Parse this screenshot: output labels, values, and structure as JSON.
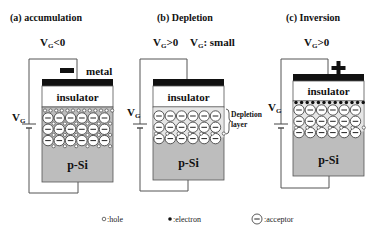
{
  "colors": {
    "metal": "#111111",
    "insulator": "#ffffff",
    "substrate": "#bdbdbd",
    "depletion_bg": "#e6e6e6",
    "acceptor_fill": "#ffffff",
    "wire": "#555555"
  },
  "panels": [
    {
      "id": "accumulation",
      "title": "(a) accumulation",
      "vg_label": "V",
      "vg_sub": "G",
      "vg_cond": "<0",
      "charge_sign": "minus",
      "metal_label": "metal",
      "insulator_label": "insulator",
      "substrate_label": "p-Si",
      "side_label": "V",
      "side_sub": "G",
      "surface": "holes"
    },
    {
      "id": "depletion",
      "title": "(b) Depletion",
      "vg_label": "V",
      "vg_sub": "G",
      "vg_cond": ">0",
      "vg_extra_label": "V",
      "vg_extra_sub": "G",
      "vg_extra": ": small",
      "insulator_label": "insulator",
      "substrate_label": "p-Si",
      "side_label": "V",
      "side_sub": "G",
      "depletion_label_1": "Depletion",
      "depletion_label_2": "layer",
      "surface": "none"
    },
    {
      "id": "inversion",
      "title": "(c) Inversion",
      "vg_label": "V",
      "vg_sub": "G",
      "vg_cond": ">0",
      "charge_sign": "plus",
      "insulator_label": "insulator",
      "substrate_label": "p-Si",
      "side_label": "V",
      "side_sub": "G",
      "surface": "electrons"
    }
  ],
  "legend": [
    {
      "symbol": "hole",
      "label": ":hole"
    },
    {
      "symbol": "electron",
      "label": ":electron"
    },
    {
      "symbol": "acceptor",
      "label": ":acceptor"
    }
  ]
}
